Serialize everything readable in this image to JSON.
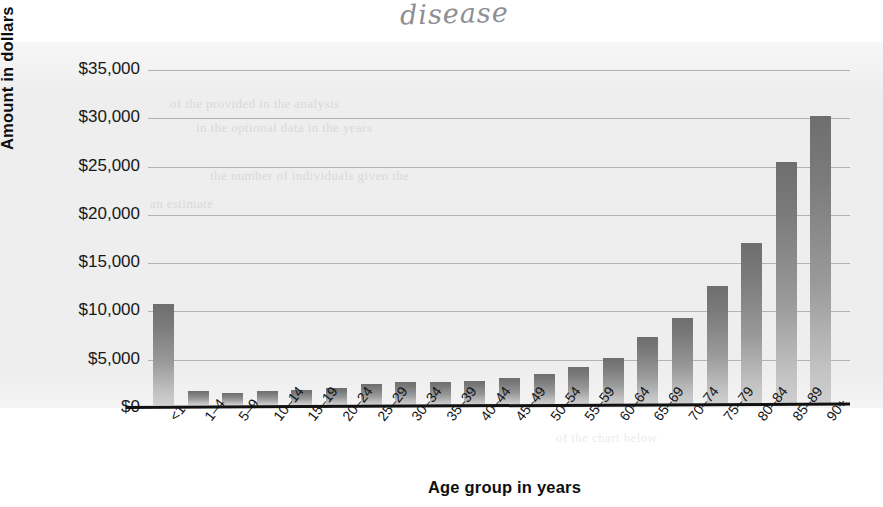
{
  "annotation": {
    "handwritten_note": "disease"
  },
  "chart_data": {
    "type": "bar",
    "title": "",
    "xlabel": "Age group in years",
    "ylabel": "Amount in dollars",
    "ylim": [
      0,
      35000
    ],
    "ytick_labels": [
      "$35,000",
      "$30,000",
      "$25,000",
      "$20,000",
      "$15,000",
      "$10,000",
      "$5,000",
      "$0"
    ],
    "ytick_values": [
      35000,
      30000,
      25000,
      20000,
      15000,
      10000,
      5000,
      0
    ],
    "grid": true,
    "legend": null,
    "categories": [
      "<1",
      "1–4",
      "5–9",
      "10–14",
      "15–19",
      "20–24",
      "25–29",
      "30–34",
      "35–39",
      "40–44",
      "45–49",
      "50–54",
      "55–59",
      "60–64",
      "65–69",
      "70–74",
      "75–79",
      "80–84",
      "85–89",
      "90+"
    ],
    "values": [
      10500,
      1500,
      1200,
      1500,
      1600,
      1800,
      2200,
      2400,
      2400,
      2450,
      2800,
      3200,
      3900,
      4900,
      7000,
      9000,
      12300,
      16800,
      25200,
      29900
    ],
    "bar_color_top": "#6e6e6e",
    "bar_color_bottom": "#cfcfcf",
    "gridline_color": "#b2b2b2",
    "axis_color": "#111111",
    "background_color": "#eeeeee"
  },
  "ghost_text": {
    "line1": "of the provided in the analysis",
    "line2": "in the optional data in the years",
    "line3": "the number of individuals given the",
    "line4": "an estimate",
    "line5": "of the chart below"
  }
}
